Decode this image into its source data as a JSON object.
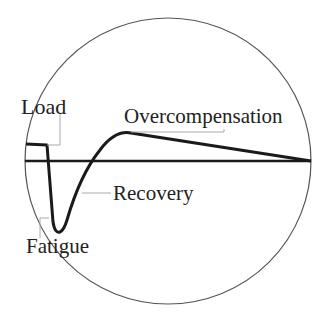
{
  "diagram": {
    "labels": {
      "load": "Load",
      "overcompensation": "Overcompensation",
      "recovery": "Recovery",
      "fatigue": "Fatigue"
    },
    "colors": {
      "curve": "#1a1a1a",
      "circle": "#555555",
      "leader": "#aaaaaa",
      "text": "#222222"
    }
  }
}
